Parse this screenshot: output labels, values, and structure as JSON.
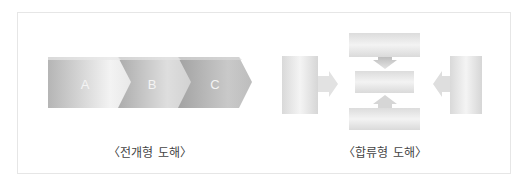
{
  "diagrams": [
    {
      "id": "development",
      "caption": "〈전개형 도해〉",
      "steps": [
        {
          "label": "A"
        },
        {
          "label": "B"
        },
        {
          "label": "C"
        }
      ]
    },
    {
      "id": "merge",
      "caption": "〈합류형 도해〉",
      "boxes": [
        "top",
        "center",
        "bottom",
        "left",
        "right"
      ],
      "arrows": [
        "top-down",
        "bottom-up",
        "left-right",
        "right-left"
      ]
    }
  ],
  "colors": {
    "frame_border": "#e6e6e6",
    "chevron_dark": "#a9a9a9",
    "chevron_light": "#f0f0f0",
    "box_light": "#f2f2f2",
    "box_dark": "#cfcfcf",
    "caption": "#444444"
  }
}
